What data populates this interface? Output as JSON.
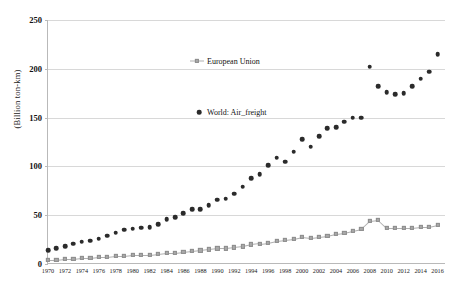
{
  "chart_data": {
    "type": "scatter",
    "title": "",
    "xlabel": "",
    "ylabel": "(Billion  ton-km)",
    "ylim": [
      0,
      250
    ],
    "yticks": [
      0,
      50,
      100,
      150,
      200,
      250
    ],
    "xlim": [
      1970,
      2017
    ],
    "xticks": [
      1970,
      1972,
      1974,
      1976,
      1978,
      1980,
      1982,
      1984,
      1986,
      1988,
      1990,
      1992,
      1994,
      1996,
      1998,
      2000,
      2002,
      2004,
      2006,
      2008,
      2010,
      2012,
      2014,
      2016
    ],
    "grid": true,
    "legend_position": "inside-upper-center",
    "x": [
      1970,
      1971,
      1972,
      1973,
      1974,
      1975,
      1976,
      1977,
      1978,
      1979,
      1980,
      1981,
      1982,
      1983,
      1984,
      1985,
      1986,
      1987,
      1988,
      1989,
      1990,
      1991,
      1992,
      1993,
      1994,
      1995,
      1996,
      1997,
      1998,
      1999,
      2000,
      2001,
      2002,
      2003,
      2004,
      2005,
      2006,
      2007,
      2008,
      2009,
      2010,
      2011,
      2012,
      2013,
      2014,
      2015,
      2016
    ],
    "series": [
      {
        "name": "World: Air_freight",
        "marker": "circle",
        "color": "#2b2b2b",
        "values": [
          14,
          16,
          18,
          21,
          23,
          24,
          26,
          29,
          32,
          35,
          36,
          37,
          38,
          41,
          46,
          48,
          52,
          56,
          56,
          60,
          66,
          67,
          72,
          79,
          88,
          92,
          101,
          109,
          105,
          115,
          128,
          120,
          131,
          139,
          140,
          146,
          150,
          150,
          202,
          182,
          176,
          174,
          175,
          182,
          190,
          197,
          215
        ]
      },
      {
        "name": "European Union",
        "marker": "square",
        "color": "#a9a9a9",
        "line": true,
        "values": [
          4,
          4,
          5,
          5,
          6,
          6,
          7,
          7,
          8,
          8,
          9,
          9,
          9,
          10,
          11,
          11,
          12,
          13,
          14,
          15,
          16,
          16,
          17,
          18,
          20,
          21,
          22,
          24,
          25,
          26,
          28,
          27,
          28,
          29,
          31,
          32,
          34,
          36,
          44,
          45,
          37,
          37,
          37,
          37,
          38,
          38,
          40
        ]
      }
    ]
  },
  "legend": {
    "eu_label": "European Union",
    "world_label": "World: Air_freight"
  }
}
